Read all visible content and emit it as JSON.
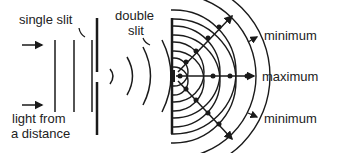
{
  "diagram": {
    "labels": {
      "single_slit": "single slit",
      "double_slit_line1": "double",
      "double_slit_line2": "slit",
      "light_line1": "light from",
      "light_line2": "a distance",
      "minimum_top": "minimum",
      "maximum": "maximum",
      "minimum_bottom": "minimum"
    },
    "colors": {
      "ink": "#1a1a1a",
      "background": "#ffffff"
    }
  }
}
